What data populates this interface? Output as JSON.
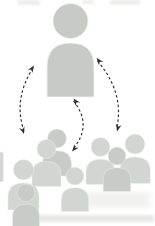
{
  "diagram": {
    "leader": {
      "icon": "person-icon",
      "count": 1
    },
    "crowd": {
      "icon": "person-icon",
      "count": 8,
      "groups": [
        {
          "name": "center-back-pair",
          "count": 2
        },
        {
          "name": "left-pair",
          "count": 2
        },
        {
          "name": "center-single",
          "count": 1
        },
        {
          "name": "right-trio",
          "count": 3
        }
      ]
    },
    "arrows": [
      {
        "name": "left-arrow",
        "between": [
          "crowd-left",
          "leader"
        ],
        "bidirectional": true,
        "line_style": "dashed",
        "curve": "bows-left"
      },
      {
        "name": "center-arrow",
        "between": [
          "leader",
          "crowd-center"
        ],
        "bidirectional": true,
        "line_style": "dashed",
        "curve": "bows-right"
      },
      {
        "name": "right-arrow",
        "between": [
          "leader",
          "crowd-right"
        ],
        "bidirectional": true,
        "line_style": "dashed",
        "curve": "bows-right"
      }
    ]
  },
  "colors": {
    "background": "#ffffff",
    "leader_fill": "#c8cac7",
    "crowd_fill_front": "#d3d5d2",
    "crowd_fill_back": "#c9cbc8",
    "arrow": "#2e2e2e"
  }
}
